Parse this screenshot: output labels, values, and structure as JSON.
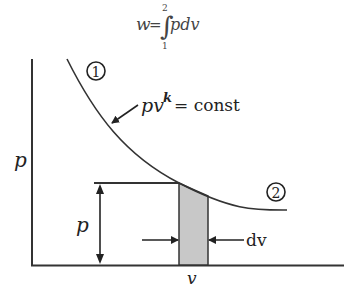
{
  "formula": {
    "lhs": "w",
    "equals": "=",
    "integral": "∫",
    "upper_limit": "2",
    "lower_limit": "1",
    "integrand": "pdv"
  },
  "diagram": {
    "y_axis_label": "p",
    "x_axis_label": "v",
    "curve_label_base": "pv",
    "curve_label_exp": "k",
    "curve_label_rhs": "= const",
    "state_1": "1",
    "state_2": "2",
    "pressure_label": "p",
    "dv_label": "dv",
    "colors": {
      "line": "#333333",
      "strip_fill": "#c8c8c8",
      "background": "#ffffff"
    }
  }
}
